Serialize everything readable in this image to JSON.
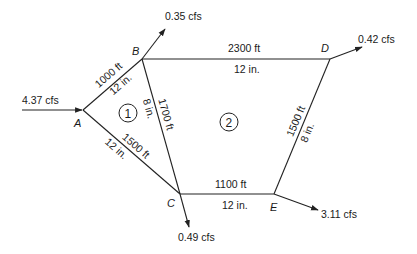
{
  "diagram": {
    "type": "pipe-network",
    "nodes": [
      {
        "id": "A",
        "label": "A"
      },
      {
        "id": "B",
        "label": "B"
      },
      {
        "id": "C",
        "label": "C"
      },
      {
        "id": "D",
        "label": "D"
      },
      {
        "id": "E",
        "label": "E"
      }
    ],
    "loops": [
      {
        "id": "1",
        "label": "1"
      },
      {
        "id": "2",
        "label": "2"
      }
    ],
    "pipes": [
      {
        "from": "A",
        "to": "B",
        "length": "1000 ft",
        "diameter": "12 in."
      },
      {
        "from": "A",
        "to": "C",
        "length": "1500 ft",
        "diameter": "12 in."
      },
      {
        "from": "B",
        "to": "C",
        "length": "1700 ft",
        "diameter": "8 in."
      },
      {
        "from": "B",
        "to": "D",
        "length": "2300 ft",
        "diameter": "12 in."
      },
      {
        "from": "D",
        "to": "E",
        "length": "1500 ft",
        "diameter": "8 in."
      },
      {
        "from": "C",
        "to": "E",
        "length": "1100 ft",
        "diameter": "12 in."
      }
    ],
    "flows": [
      {
        "node": "A",
        "direction": "inflow",
        "value": "4.37 cfs"
      },
      {
        "node": "B",
        "direction": "outflow",
        "value": "0.35 cfs"
      },
      {
        "node": "D",
        "direction": "outflow",
        "value": "0.42 cfs"
      },
      {
        "node": "C",
        "direction": "outflow",
        "value": "0.49 cfs"
      },
      {
        "node": "E",
        "direction": "outflow",
        "value": "3.11 cfs"
      }
    ]
  }
}
